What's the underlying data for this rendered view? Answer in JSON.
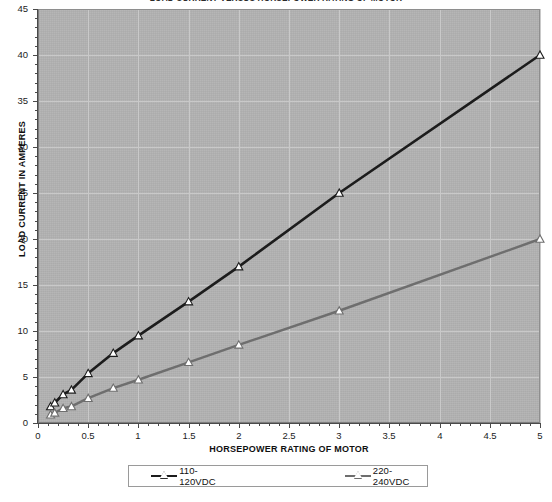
{
  "chart_data": {
    "type": "line",
    "title": "LOAD CURRENT VERSUS HORSEPOWER RATING OF MOTOR",
    "xlabel": "HORSEPOWER RATING OF MOTOR",
    "ylabel": "LOAD CURRENT IN AMPERES",
    "xlim": [
      0,
      5
    ],
    "ylim": [
      0,
      45
    ],
    "x_ticks": [
      "0",
      "0.5",
      "1",
      "1.5",
      "2",
      "2.5",
      "3",
      "3.5",
      "4",
      "4.5",
      "5"
    ],
    "x_tick_values": [
      0,
      0.5,
      1,
      1.5,
      2,
      2.5,
      3,
      3.5,
      4,
      4.5,
      5
    ],
    "y_ticks": [
      "0",
      "5",
      "10",
      "15",
      "20",
      "25",
      "30",
      "35",
      "40",
      "45"
    ],
    "y_tick_values": [
      0,
      5,
      10,
      15,
      20,
      25,
      30,
      35,
      40,
      45
    ],
    "grid": true,
    "legend_position": "bottom",
    "x": [
      0.125,
      0.1667,
      0.25,
      0.3333,
      0.5,
      0.75,
      1,
      1.5,
      2,
      3,
      5
    ],
    "series": [
      {
        "name": "110-120VDC",
        "color": "#1c1c1c",
        "marker": "triangle",
        "values": [
          1.8,
          2.2,
          3.1,
          3.6,
          5.4,
          7.6,
          9.5,
          13.2,
          17.0,
          25.0,
          40.0
        ]
      },
      {
        "name": "220-240VDC",
        "color": "#6e6e6e",
        "marker": "triangle",
        "values": [
          0.9,
          1.1,
          1.6,
          1.8,
          2.7,
          3.8,
          4.7,
          6.6,
          8.5,
          12.2,
          20.0
        ]
      }
    ],
    "plot_background": "#b2b2b2",
    "gridline_color": "#c9c9c9"
  },
  "legend": {
    "entries": [
      {
        "label": "110-120VDC"
      },
      {
        "label": "220-240VDC"
      }
    ]
  }
}
